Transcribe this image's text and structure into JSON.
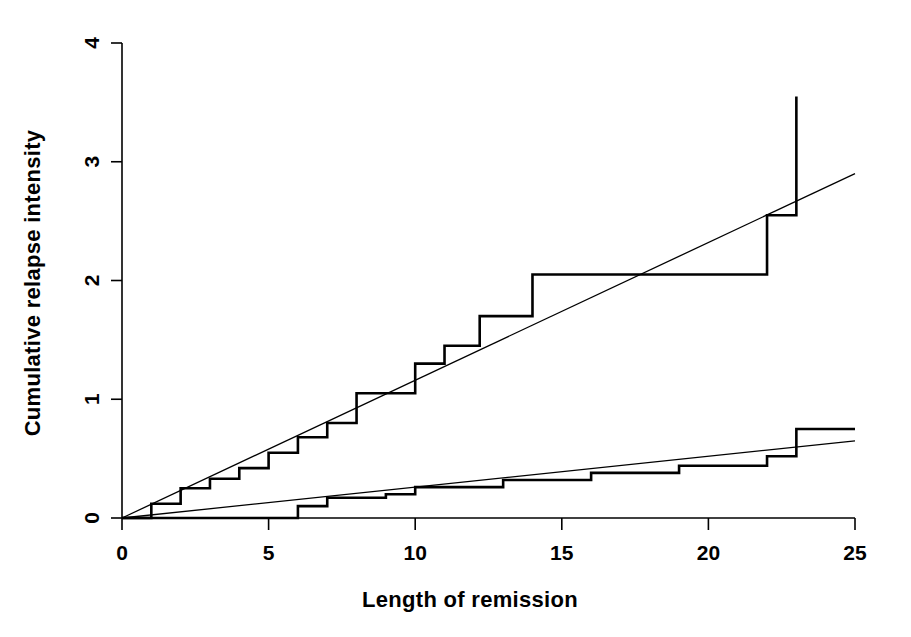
{
  "chart_data": {
    "type": "line",
    "title": "",
    "xlabel": "Length of remission",
    "ylabel": "Cumulative relapse intensity",
    "xlim": [
      0,
      25
    ],
    "ylim": [
      0,
      4
    ],
    "xticks": [
      0,
      5,
      10,
      15,
      20,
      25
    ],
    "xtick_labels": [
      "0",
      "5",
      "10",
      "15",
      "20",
      "25"
    ],
    "yticks": [
      0,
      1,
      2,
      3,
      4
    ],
    "ytick_labels": [
      "0",
      "1",
      "2",
      "3",
      "4"
    ],
    "grid": false,
    "legend": "none",
    "series": [
      {
        "name": "upper-cumulative-step",
        "style": "step",
        "linewidth": 2.6,
        "color": "#000000",
        "points": [
          [
            0,
            0
          ],
          [
            1,
            0
          ],
          [
            1,
            0.12
          ],
          [
            2,
            0.12
          ],
          [
            2,
            0.25
          ],
          [
            3,
            0.25
          ],
          [
            3,
            0.33
          ],
          [
            4,
            0.33
          ],
          [
            4,
            0.42
          ],
          [
            5,
            0.42
          ],
          [
            5,
            0.55
          ],
          [
            6,
            0.55
          ],
          [
            6,
            0.68
          ],
          [
            7,
            0.68
          ],
          [
            7,
            0.8
          ],
          [
            8,
            0.8
          ],
          [
            8,
            1.05
          ],
          [
            10,
            1.05
          ],
          [
            10,
            1.3
          ],
          [
            11,
            1.3
          ],
          [
            11,
            1.45
          ],
          [
            12.2,
            1.45
          ],
          [
            12.2,
            1.7
          ],
          [
            14,
            1.7
          ],
          [
            14,
            2.05
          ],
          [
            17,
            2.05
          ],
          [
            17,
            2.05
          ],
          [
            22,
            2.05
          ],
          [
            22,
            2.55
          ],
          [
            23,
            2.55
          ],
          [
            23,
            3.55
          ]
        ]
      },
      {
        "name": "upper-fitted-line",
        "style": "line",
        "linewidth": 1.3,
        "color": "#000000",
        "points": [
          [
            0,
            0
          ],
          [
            25,
            2.9
          ]
        ]
      },
      {
        "name": "lower-cumulative-step",
        "style": "step",
        "linewidth": 2.6,
        "color": "#000000",
        "points": [
          [
            0,
            0
          ],
          [
            6,
            0
          ],
          [
            6,
            0.1
          ],
          [
            7,
            0.1
          ],
          [
            7,
            0.17
          ],
          [
            9,
            0.17
          ],
          [
            9,
            0.2
          ],
          [
            10,
            0.2
          ],
          [
            10,
            0.26
          ],
          [
            13,
            0.26
          ],
          [
            13,
            0.32
          ],
          [
            16,
            0.32
          ],
          [
            16,
            0.38
          ],
          [
            19,
            0.38
          ],
          [
            19,
            0.44
          ],
          [
            22,
            0.44
          ],
          [
            22,
            0.52
          ],
          [
            23,
            0.52
          ],
          [
            23,
            0.75
          ],
          [
            25,
            0.75
          ]
        ]
      },
      {
        "name": "lower-fitted-line",
        "style": "line",
        "linewidth": 1.3,
        "color": "#000000",
        "points": [
          [
            0,
            0
          ],
          [
            25,
            0.65
          ]
        ]
      }
    ]
  },
  "axes": {
    "x_axis_name": "x-axis",
    "y_axis_name": "y-axis"
  }
}
